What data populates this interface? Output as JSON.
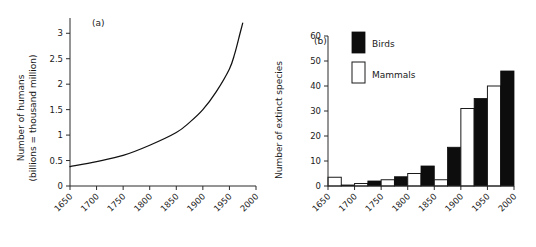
{
  "figure": {
    "background": "#ffffff",
    "ink": "#1a1a1a"
  },
  "panel_a": {
    "label": "(a)",
    "ylabel_line1": "Number of humans",
    "ylabel_line2": "(billions = thousand million)"
  },
  "panel_b": {
    "label": "(b)",
    "ylabel": "Number of extinct species",
    "legend": [
      {
        "key": "birds",
        "label": "Birds",
        "color": "#0d0d0d",
        "style": "filled"
      },
      {
        "key": "mammals",
        "label": "Mammals",
        "color": "#ffffff",
        "style": "outline"
      }
    ]
  },
  "chart_data": [
    {
      "id": "human-population-growth",
      "type": "line",
      "title": "(a)",
      "xlabel": "",
      "ylabel": "Number of humans (billions = thousand million)",
      "xlim": [
        1650,
        2000
      ],
      "ylim": [
        0,
        3.3
      ],
      "xticks": [
        1650,
        1700,
        1750,
        1800,
        1850,
        1900,
        1950,
        2000
      ],
      "xticklabels": [
        "1650",
        "1700",
        "1750",
        "1800",
        "1850",
        "1900",
        "1950",
        "2000"
      ],
      "yticks": [
        0,
        0.5,
        1,
        1.5,
        2,
        2.5,
        3
      ],
      "yticklabels": [
        "0",
        "0.5",
        "1",
        "1.5",
        "2",
        "2.5",
        "3"
      ],
      "grid": false,
      "legend": "none",
      "series": [
        {
          "name": "World human population",
          "units": "billions",
          "x": [
            1650,
            1700,
            1750,
            1800,
            1850,
            1875,
            1900,
            1925,
            1950,
            1960,
            1970,
            1975
          ],
          "y": [
            0.38,
            0.48,
            0.6,
            0.8,
            1.05,
            1.25,
            1.5,
            1.85,
            2.3,
            2.6,
            3.0,
            3.2
          ]
        }
      ]
    },
    {
      "id": "extinct-species-by-half-century",
      "type": "bar",
      "title": "(b)",
      "xlabel": "",
      "ylabel": "Number of extinct species",
      "xlim": [
        1650,
        2000
      ],
      "ylim": [
        0,
        60
      ],
      "xticks": [
        1650,
        1700,
        1750,
        1800,
        1850,
        1900,
        1950,
        2000
      ],
      "xticklabels": [
        "1650",
        "1700",
        "1750",
        "1800",
        "1850",
        "1900",
        "1950",
        "2000"
      ],
      "yticks": [
        0,
        10,
        20,
        30,
        40,
        50,
        60
      ],
      "yticklabels": [
        "0",
        "10",
        "20",
        "30",
        "40",
        "50",
        "60"
      ],
      "grid": false,
      "legend": "upper left",
      "categories": [
        "1650-1700",
        "1700-1750",
        "1750-1800",
        "1800-1850",
        "1850-1900",
        "1900-1950",
        "1950-2000"
      ],
      "series": [
        {
          "name": "Mammals",
          "color": "#ffffff",
          "values": [
            3.5,
            1,
            2.5,
            5,
            2.5,
            31,
            40
          ]
        },
        {
          "name": "Birds",
          "color": "#0d0d0d",
          "values": [
            0.4,
            2,
            3.7,
            8,
            15.5,
            35,
            46
          ]
        }
      ]
    }
  ]
}
